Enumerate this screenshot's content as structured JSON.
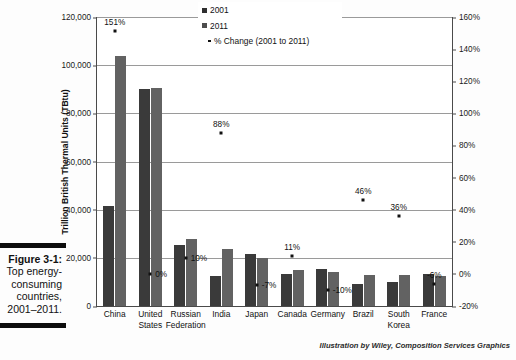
{
  "figure": {
    "caption_label": "Figure 3-1:",
    "caption_lines": [
      "Top energy-",
      "consuming",
      "countries,",
      "2001–2011."
    ]
  },
  "credit": "Illustration by Wiley, Composition Services Graphics",
  "legend": {
    "items": [
      {
        "label": "2001",
        "marker": "square-swatch-dark"
      },
      {
        "label": "2011",
        "marker": "square-swatch-gray"
      },
      {
        "label": "% Change (2001 to 2011)",
        "marker": "dot-marker"
      }
    ]
  },
  "chart_data": {
    "type": "bar",
    "title": "",
    "subtitle": "",
    "xlabel": "",
    "ylabel": "Trillion British Thermal Units (TBtu)",
    "y2label": "",
    "grid": true,
    "legend_position": "top-right",
    "categories": [
      "China",
      "United States",
      "Russian Federation",
      "India",
      "Japan",
      "Canada",
      "Germany",
      "Brazil",
      "South Korea",
      "France"
    ],
    "category_lines": [
      [
        "China",
        ""
      ],
      [
        "United",
        "States"
      ],
      [
        "Russian",
        "Federation"
      ],
      [
        "India",
        ""
      ],
      [
        "Japan",
        ""
      ],
      [
        "Canada",
        ""
      ],
      [
        "Germany",
        ""
      ],
      [
        "Brazil",
        ""
      ],
      [
        "South",
        "Korea"
      ],
      [
        "France",
        ""
      ]
    ],
    "series": [
      {
        "name": "2001",
        "color": "#3a3a3a",
        "axis": "left",
        "values": [
          41500,
          90000,
          25500,
          12500,
          21500,
          13500,
          15500,
          9000,
          10000,
          13500
        ]
      },
      {
        "name": "2011",
        "color": "#626262",
        "axis": "left",
        "values": [
          104000,
          90500,
          28000,
          23500,
          20000,
          15000,
          14000,
          13000,
          13000,
          12500
        ]
      },
      {
        "name": "% Change (2001 to 2011)",
        "color": "#111111",
        "axis": "right",
        "type": "scatter",
        "values": [
          151,
          0,
          10,
          88,
          -7,
          11,
          -10,
          46,
          36,
          -6
        ],
        "labels": [
          "151%",
          "0%",
          "10%",
          "88%",
          "-7%",
          "11%",
          "-10%",
          "46%",
          "36%",
          "-6%"
        ]
      }
    ],
    "ylim": [
      0,
      120000
    ],
    "yticks": [
      0,
      20000,
      40000,
      60000,
      80000,
      100000,
      120000
    ],
    "ytick_labels": [
      "0",
      "20,000",
      "40,000",
      "60,000",
      "80,000",
      "100,000",
      "120,000"
    ],
    "y2lim": [
      -20,
      160
    ],
    "y2ticks": [
      -20,
      0,
      20,
      40,
      60,
      80,
      100,
      120,
      140,
      160
    ],
    "y2tick_labels": [
      "-20%",
      "0%",
      "20%",
      "40%",
      "60%",
      "80%",
      "100%",
      "120%",
      "140%",
      "160%"
    ]
  }
}
